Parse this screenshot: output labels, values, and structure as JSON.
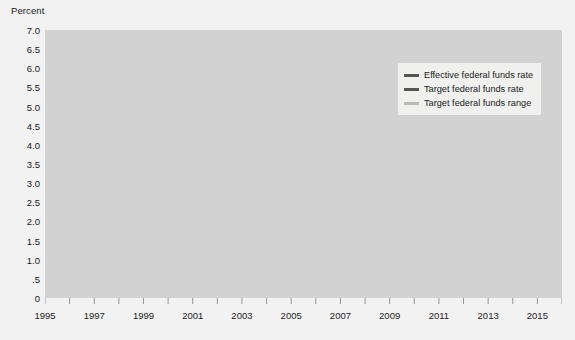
{
  "chart_data": {
    "type": "line",
    "title": "",
    "ylabel": "Percent",
    "xlabel": "",
    "ylim": [
      0,
      7.0
    ],
    "xlim": [
      1995.0,
      2016.0
    ],
    "grid": true,
    "legend_position": "upper-right",
    "yticks": [
      "7.0",
      "6.5",
      "6.0",
      "5.5",
      "5.0",
      "4.5",
      "4.0",
      "3.5",
      "3.0",
      "2.5",
      "2.0",
      "1.5",
      "1.0",
      ".5",
      "0"
    ],
    "ytick_values": [
      7.0,
      6.5,
      6.0,
      5.5,
      5.0,
      4.5,
      4.0,
      3.5,
      3.0,
      2.5,
      2.0,
      1.5,
      1.0,
      0.5,
      0.0
    ],
    "xticks": [
      "1995",
      "1997",
      "1999",
      "2001",
      "2003",
      "2005",
      "2007",
      "2009",
      "2011",
      "2013",
      "2015"
    ],
    "xtick_values": [
      1995,
      1997,
      1999,
      2001,
      2003,
      2005,
      2007,
      2009,
      2011,
      2013,
      2015
    ],
    "xminor_values": [
      1996,
      1998,
      2000,
      2002,
      2004,
      2006,
      2008,
      2010,
      2012,
      2014,
      2016
    ],
    "colors": {
      "effective": "#555555",
      "target": "#555555",
      "range": "#b9b9b9",
      "plot_background": "#d2d2d2",
      "figure_background": "#f2f2f2",
      "gridline": "#bdbdbd",
      "axis": "#8a8a8a",
      "text": "#1a1a1a",
      "legend_background": "#f0f0ee"
    },
    "series": [
      {
        "name": "Effective federal funds rate",
        "color": "#555555",
        "x": [
          1995.0,
          1995.08,
          1995.17,
          1995.25,
          1995.33,
          1995.42,
          1995.5,
          1995.58,
          1995.67,
          1995.75,
          1995.83,
          1995.92,
          1996.0,
          1996.08,
          1996.17,
          1996.25,
          1996.33,
          1996.42,
          1996.5,
          1996.58,
          1996.67,
          1996.75,
          1996.83,
          1996.92,
          1997.0,
          1997.08,
          1997.17,
          1997.25,
          1997.33,
          1997.42,
          1997.5,
          1997.58,
          1997.67,
          1997.75,
          1997.83,
          1997.92,
          1998.0,
          1998.08,
          1998.17,
          1998.25,
          1998.33,
          1998.42,
          1998.5,
          1998.58,
          1998.67,
          1998.75,
          1998.83,
          1998.92,
          1999.0,
          1999.08,
          1999.17,
          1999.25,
          1999.33,
          1999.42,
          1999.5,
          1999.58,
          1999.67,
          1999.75,
          1999.83,
          1999.92,
          2000.0,
          2000.08,
          2000.17,
          2000.25,
          2000.33,
          2000.42,
          2000.5,
          2000.58,
          2000.67,
          2000.75,
          2000.83,
          2000.92,
          2001.0,
          2001.08,
          2001.17,
          2001.25,
          2001.33,
          2001.42,
          2001.5,
          2001.58,
          2001.67,
          2001.75,
          2001.83,
          2001.92,
          2002.0,
          2002.25,
          2002.5,
          2002.75,
          2002.92,
          2003.0,
          2003.25,
          2003.42,
          2003.5,
          2003.75,
          2004.0,
          2004.25,
          2004.5,
          2004.58,
          2004.67,
          2004.75,
          2004.83,
          2004.92,
          2005.0,
          2005.17,
          2005.25,
          2005.42,
          2005.5,
          2005.67,
          2005.75,
          2005.92,
          2006.0,
          2006.17,
          2006.25,
          2006.42,
          2006.5,
          2006.67,
          2006.75,
          2006.92,
          2007.0,
          2007.25,
          2007.5,
          2007.67,
          2007.75,
          2007.83,
          2007.92,
          2008.0,
          2008.08,
          2008.17,
          2008.25,
          2008.33,
          2008.5,
          2008.67,
          2008.75,
          2008.83,
          2008.92,
          2009.0,
          2009.25,
          2009.5,
          2009.75,
          2010.0,
          2010.25,
          2010.5,
          2010.75,
          2011.0,
          2011.25,
          2011.5,
          2011.75,
          2012.0,
          2012.25,
          2012.5,
          2012.75,
          2013.0,
          2013.25,
          2013.5,
          2013.75,
          2014.0,
          2014.25,
          2014.5,
          2014.75,
          2015.0,
          2015.25,
          2015.5,
          2015.75,
          2015.92,
          2015.96,
          2016.0
        ],
        "y": [
          5.9,
          6.0,
          5.95,
          6.05,
          6.0,
          5.75,
          5.8,
          5.7,
          5.75,
          5.8,
          5.75,
          5.6,
          5.55,
          5.22,
          5.3,
          5.22,
          5.25,
          5.28,
          5.4,
          5.22,
          5.3,
          5.25,
          5.28,
          5.3,
          5.25,
          5.28,
          5.3,
          5.5,
          5.5,
          5.55,
          5.52,
          5.55,
          5.5,
          5.52,
          5.5,
          5.58,
          5.55,
          5.5,
          5.52,
          5.5,
          5.52,
          5.55,
          5.55,
          5.5,
          5.3,
          5.1,
          4.85,
          4.7,
          4.75,
          4.78,
          4.82,
          4.75,
          4.8,
          4.85,
          5.0,
          5.05,
          5.25,
          5.3,
          5.42,
          5.6,
          5.68,
          5.75,
          5.85,
          6.02,
          6.27,
          6.53,
          6.55,
          6.5,
          6.9,
          6.52,
          6.55,
          6.5,
          6.4,
          5.95,
          5.3,
          4.8,
          4.2,
          3.95,
          3.75,
          3.6,
          3.05,
          2.4,
          2.0,
          1.82,
          1.72,
          1.75,
          1.75,
          1.74,
          1.45,
          1.25,
          1.25,
          1.22,
          1.02,
          1.0,
          1.0,
          1.0,
          1.03,
          1.28,
          1.43,
          1.5,
          1.76,
          1.98,
          2.25,
          2.5,
          2.63,
          2.79,
          3.0,
          3.26,
          3.5,
          3.96,
          4.29,
          4.5,
          4.79,
          4.94,
          5.0,
          5.25,
          5.25,
          5.25,
          5.25,
          5.25,
          5.26,
          5.02,
          4.76,
          4.49,
          4.24,
          3.94,
          2.98,
          2.61,
          2.28,
          1.98,
          2.0,
          1.81,
          0.97,
          0.39,
          0.16,
          0.15,
          0.18,
          0.16,
          0.12,
          0.13,
          0.2,
          0.18,
          0.19,
          0.16,
          0.09,
          0.08,
          0.07,
          0.1,
          0.15,
          0.14,
          0.16,
          0.14,
          0.12,
          0.08,
          0.09,
          0.07,
          0.09,
          0.09,
          0.09,
          0.11,
          0.12,
          0.14,
          0.13,
          0.14,
          0.2,
          0.36
        ]
      },
      {
        "name": "Target federal funds rate",
        "color": "#555555",
        "x": [
          1995.0,
          1995.5,
          1995.54,
          1995.92,
          1995.96,
          1996.08,
          1996.12,
          1997.17,
          1997.21,
          1998.67,
          1998.71,
          1998.75,
          1998.79,
          1998.83,
          1998.87,
          1999.5,
          1999.54,
          1999.67,
          1999.71,
          1999.83,
          1999.87,
          2000.08,
          2000.12,
          2000.25,
          2000.29,
          2000.42,
          2000.46,
          2001.0,
          2001.04,
          2001.08,
          2001.12,
          2001.21,
          2001.25,
          2001.33,
          2001.37,
          2001.42,
          2001.46,
          2001.5,
          2001.54,
          2001.71,
          2001.75,
          2001.79,
          2001.83,
          2001.87,
          2001.92,
          2002.92,
          2002.96,
          2003.5,
          2003.54,
          2004.5,
          2004.54,
          2004.67,
          2004.71,
          2004.83,
          2004.87,
          2004.96,
          2005.0,
          2005.17,
          2005.21,
          2005.33,
          2005.37,
          2005.5,
          2005.54,
          2005.67,
          2005.71,
          2005.83,
          2005.87,
          2006.0,
          2006.04,
          2006.17,
          2006.21,
          2006.33,
          2006.37,
          2006.46,
          2006.5,
          2007.71,
          2007.75,
          2007.83,
          2007.87,
          2007.96,
          2008.0,
          2008.08,
          2008.12,
          2008.17,
          2008.21,
          2008.25,
          2008.29,
          2008.33,
          2008.37,
          2008.79,
          2008.83,
          2008.87,
          2008.92
        ],
        "y": [
          6.0,
          6.0,
          5.75,
          5.75,
          5.5,
          5.5,
          5.25,
          5.25,
          5.5,
          5.5,
          5.25,
          5.25,
          5.0,
          5.0,
          4.75,
          4.75,
          5.0,
          5.0,
          5.25,
          5.25,
          5.5,
          5.5,
          5.75,
          5.75,
          6.0,
          6.0,
          6.5,
          6.5,
          6.0,
          6.0,
          5.5,
          5.5,
          5.0,
          5.0,
          4.5,
          4.5,
          4.0,
          4.0,
          3.75,
          3.75,
          3.5,
          3.5,
          3.0,
          3.0,
          2.0,
          2.0,
          1.75,
          1.75,
          1.0,
          1.0,
          1.25,
          1.25,
          1.5,
          1.5,
          1.75,
          1.75,
          2.0,
          2.0,
          2.25,
          2.25,
          2.5,
          2.5,
          2.75,
          2.75,
          3.0,
          3.0,
          3.25,
          3.25,
          3.5,
          3.5,
          3.75,
          3.75,
          4.0,
          4.0,
          5.25,
          5.25,
          4.75,
          4.75,
          4.5,
          4.5,
          4.25,
          4.25,
          3.5,
          3.5,
          3.0,
          3.0,
          2.25,
          2.25,
          2.0,
          2.0,
          1.5,
          1.5,
          1.0
        ]
      },
      {
        "name": "Target federal funds range",
        "color": "#b9b9b9",
        "upper_x": [
          2008.96,
          2015.92,
          2015.96,
          2016.0
        ],
        "upper_y": [
          0.25,
          0.25,
          0.5,
          0.5
        ],
        "lower_x": [
          2008.96,
          2015.92,
          2015.96,
          2016.0
        ],
        "lower_y": [
          0.0,
          0.0,
          0.25,
          0.25
        ]
      }
    ],
    "legend": [
      {
        "label": "Effective federal funds rate",
        "color": "#555555"
      },
      {
        "label": "Target federal funds rate",
        "color": "#555555"
      },
      {
        "label": "Target federal funds range",
        "color": "#b9b9b9"
      }
    ]
  }
}
